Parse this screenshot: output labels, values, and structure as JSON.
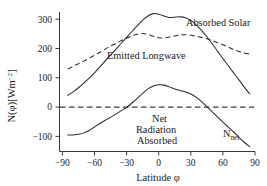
{
  "chart_data": {
    "type": "line",
    "title": "",
    "xlabel": "Latitude φ",
    "ylabel": "N(φ)[Wm⁻²]",
    "xlim": [
      -90,
      90
    ],
    "ylim": [
      -150,
      340
    ],
    "grid": false,
    "legend_position": "inline-annotations",
    "xticks": [
      -90,
      -60,
      -30,
      0,
      30,
      60,
      90
    ],
    "xtick_labels": [
      "−90",
      "−60",
      "−30",
      "0",
      "30",
      "60",
      "90"
    ],
    "yticks": [
      -100,
      0,
      100,
      200,
      300
    ],
    "ytick_labels": [
      "−100",
      "0",
      "100",
      "200",
      "300"
    ],
    "series": [
      {
        "name": "Absorbed Solar",
        "style": "solid",
        "label": "Absorbed Solar",
        "x": [
          -85,
          -80,
          -75,
          -70,
          -65,
          -60,
          -55,
          -50,
          -45,
          -40,
          -35,
          -30,
          -25,
          -20,
          -15,
          -10,
          -5,
          0,
          5,
          10,
          15,
          20,
          25,
          30,
          35,
          40,
          45,
          50,
          55,
          60,
          65,
          70,
          75,
          80,
          85
        ],
        "y": [
          40,
          52,
          66,
          82,
          99,
          117,
          137,
          158,
          178,
          197,
          218,
          238,
          258,
          278,
          297,
          311,
          319,
          317,
          311,
          306,
          307,
          308,
          305,
          296,
          281,
          262,
          240,
          216,
          191,
          166,
          141,
          117,
          93,
          68,
          45
        ]
      },
      {
        "name": "Emitted Longwave",
        "style": "dashed",
        "label": "Emitted Longwave",
        "x": [
          -85,
          -80,
          -75,
          -70,
          -65,
          -60,
          -55,
          -50,
          -45,
          -40,
          -35,
          -30,
          -25,
          -20,
          -15,
          -10,
          -5,
          0,
          5,
          10,
          15,
          20,
          25,
          30,
          35,
          40,
          45,
          50,
          55,
          60,
          65,
          70,
          75,
          80,
          85
        ],
        "y": [
          130,
          139,
          148,
          157,
          167,
          177,
          187,
          198,
          208,
          217,
          227,
          235,
          243,
          249,
          251,
          248,
          242,
          237,
          236,
          239,
          243,
          246,
          247,
          245,
          242,
          238,
          233,
          227,
          220,
          213,
          205,
          197,
          190,
          185,
          181
        ]
      },
      {
        "name": "Net Radiation Absorbed",
        "style": "solid",
        "label": "Net Radiation Absorbed",
        "short_label": "N_net",
        "x": [
          -85,
          -80,
          -75,
          -70,
          -65,
          -60,
          -55,
          -50,
          -45,
          -40,
          -35,
          -30,
          -25,
          -20,
          -15,
          -10,
          -5,
          0,
          5,
          10,
          15,
          20,
          25,
          30,
          35,
          40,
          45,
          50,
          55,
          60,
          65,
          70,
          75,
          80,
          85
        ],
        "y": [
          -95,
          -95,
          -93,
          -88,
          -80,
          -68,
          -56,
          -45,
          -35,
          -24,
          -12,
          -1,
          14,
          30,
          47,
          62,
          72,
          76,
          75,
          69,
          62,
          57,
          52,
          45,
          34,
          19,
          2,
          -16,
          -34,
          -51,
          -68,
          -85,
          -103,
          -120,
          -135
        ]
      }
    ],
    "reference_lines": [
      {
        "name": "zero-line",
        "orientation": "horizontal",
        "value": 0,
        "style": "dashed"
      }
    ],
    "annotations": [
      {
        "name": "absorbed-solar-label",
        "text": "Absorbed Solar"
      },
      {
        "name": "emitted-longwave-label",
        "text": "Emitted Longwave"
      },
      {
        "name": "net-radiation-label-line1",
        "text": "Net"
      },
      {
        "name": "net-radiation-label-line2",
        "text": "Radiation"
      },
      {
        "name": "net-radiation-label-line3",
        "text": "Absorbed"
      },
      {
        "name": "nnet-symbol-base",
        "text": "N"
      },
      {
        "name": "nnet-symbol-subscript",
        "text": "net"
      }
    ],
    "ylabel_parts": {
      "base": "N(φ)[Wm",
      "exponent": "−2",
      "close": "]"
    }
  }
}
